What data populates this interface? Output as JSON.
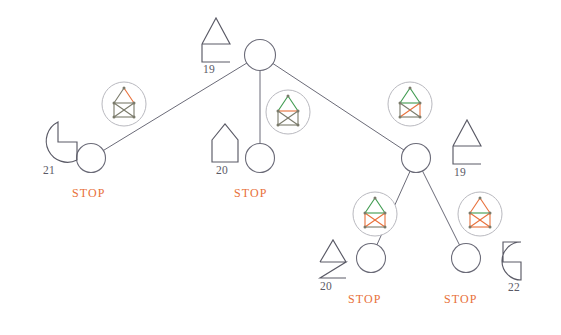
{
  "diagram": {
    "type": "tree",
    "colors": {
      "node_stroke": "#6b6b78",
      "edge_stroke": "#6b6b78",
      "shape_stroke": "#5a5a66",
      "icon_circle": "#b9b9bf",
      "icon_graph_gray": "#7a7a6a",
      "icon_green": "#3e9a4e",
      "icon_orange": "#e8703a",
      "stop_text": "#e8703a",
      "label_text": "#5a5a66",
      "background": "#ffffff"
    },
    "nodes": [
      {
        "id": "root",
        "cx": 260,
        "cy": 55,
        "r": 15.5
      },
      {
        "id": "n-left",
        "cx": 91,
        "cy": 158,
        "r": 14.5
      },
      {
        "id": "n-mid",
        "cx": 260,
        "cy": 158,
        "r": 14.5
      },
      {
        "id": "n-right",
        "cx": 416,
        "cy": 158,
        "r": 14.5
      },
      {
        "id": "n-rl",
        "cx": 371,
        "cy": 258,
        "r": 14.5
      },
      {
        "id": "n-rr",
        "cx": 466,
        "cy": 258,
        "r": 14.5
      }
    ],
    "edges": [
      {
        "from": "root",
        "to": "n-left"
      },
      {
        "from": "root",
        "to": "n-mid"
      },
      {
        "from": "root",
        "to": "n-right"
      },
      {
        "from": "n-right",
        "to": "n-rl"
      },
      {
        "from": "n-right",
        "to": "n-rr"
      }
    ],
    "edge_icons": [
      {
        "id": "icon-root-left",
        "cx": 124,
        "cy": 104,
        "r": 22,
        "variant": "diag-red-apex"
      },
      {
        "id": "icon-root-mid",
        "cx": 288,
        "cy": 112,
        "r": 22,
        "variant": "orange-middle-bar"
      },
      {
        "id": "icon-root-right",
        "cx": 410,
        "cy": 104,
        "r": 22,
        "variant": "green-top-orange-x"
      },
      {
        "id": "icon-right-rl",
        "cx": 375,
        "cy": 214,
        "r": 22,
        "variant": "green-bar-orange-x"
      },
      {
        "id": "icon-right-rr",
        "cx": 480,
        "cy": 214,
        "r": 22,
        "variant": "orange-apex-green-bar"
      }
    ],
    "shape_markers": [
      {
        "id": "marker-root",
        "x": 196,
        "y": 16,
        "w": 42,
        "h": 45,
        "glyph": "triangle-over-open-right-square",
        "value": "19"
      },
      {
        "id": "marker-left",
        "x": 38,
        "y": 118,
        "w": 40,
        "h": 45,
        "glyph": "pacman-notch-upper-right",
        "value": "21"
      },
      {
        "id": "marker-mid",
        "x": 206,
        "y": 122,
        "w": 38,
        "h": 44,
        "glyph": "house-pentagon",
        "value": "20"
      },
      {
        "id": "marker-right",
        "x": 447,
        "y": 118,
        "w": 40,
        "h": 45,
        "glyph": "triangle-over-open-top-square",
        "value": "19"
      },
      {
        "id": "marker-rl",
        "x": 313,
        "y": 236,
        "w": 38,
        "h": 42,
        "glyph": "triangle-over-zigzag",
        "value": "20"
      },
      {
        "id": "marker-rr",
        "x": 492,
        "y": 236,
        "w": 42,
        "h": 44,
        "glyph": "circle-notch-right",
        "value": "22"
      }
    ],
    "stop_labels": [
      {
        "id": "stop-left",
        "x": 72,
        "y": 186,
        "text": "STOP"
      },
      {
        "id": "stop-mid",
        "x": 234,
        "y": 186,
        "text": "STOP"
      },
      {
        "id": "stop-rl",
        "x": 348,
        "y": 292,
        "text": "STOP"
      },
      {
        "id": "stop-rr",
        "x": 444,
        "y": 292,
        "text": "STOP"
      }
    ]
  }
}
